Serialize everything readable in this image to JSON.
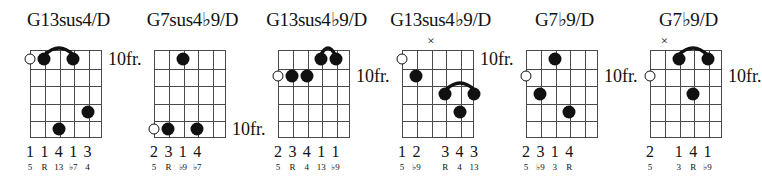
{
  "page": {
    "kind": "guitar-chord-chart",
    "fret_label": "10fr.",
    "x_mark": "×"
  },
  "chords": [
    {
      "id": "chord-1",
      "title": "G13sus4/D",
      "title_parts": {
        "text": "G13sus4/D"
      },
      "position_label": "10fr.",
      "position_label_fret_row": 1,
      "strings": 6,
      "frets": 5,
      "open_strings": [
        1
      ],
      "muted_strings": [],
      "dots": [
        {
          "string": 2,
          "fret": 1
        },
        {
          "string": 4,
          "fret": 1
        },
        {
          "string": 5,
          "fret": 4
        },
        {
          "string": 3,
          "fret": 5
        }
      ],
      "barres": [
        {
          "fret": 1,
          "from_string": 2,
          "to_string": 4
        }
      ],
      "fingers": [
        "1",
        "1",
        "4",
        "1",
        "3",
        ""
      ],
      "intervals": [
        "5",
        "R",
        "13",
        "♭7",
        "4",
        ""
      ]
    },
    {
      "id": "chord-2",
      "title": "G7sus4♭9/D",
      "title_parts": {
        "text": "G7sus4♭9/D"
      },
      "position_label": "10fr.",
      "position_label_fret_row": 5,
      "strings": 6,
      "frets": 5,
      "open_strings": [
        1
      ],
      "muted_strings": [],
      "dots": [
        {
          "string": 3,
          "fret": 1
        },
        {
          "string": 2,
          "fret": 5
        },
        {
          "string": 4,
          "fret": 5
        }
      ],
      "barres": [],
      "fingers": [
        "2",
        "3",
        "1",
        "4",
        "",
        ""
      ],
      "intervals": [
        "5",
        "R",
        "♭9",
        "♭7",
        "",
        ""
      ]
    },
    {
      "id": "chord-3",
      "title": "G13sus4♭9/D",
      "title_parts": {
        "text": "G13sus4♭9/D"
      },
      "position_label": "10fr.",
      "position_label_fret_row": 2,
      "strings": 6,
      "frets": 5,
      "open_strings": [
        1
      ],
      "muted_strings": [],
      "dots": [
        {
          "string": 4,
          "fret": 1
        },
        {
          "string": 5,
          "fret": 1
        },
        {
          "string": 2,
          "fret": 2
        },
        {
          "string": 3,
          "fret": 2
        }
      ],
      "barres": [
        {
          "fret": 1,
          "from_string": 4,
          "to_string": 5
        }
      ],
      "fingers": [
        "2",
        "3",
        "4",
        "1",
        "1",
        ""
      ],
      "intervals": [
        "5",
        "R",
        "4",
        "13",
        "♭9",
        ""
      ]
    },
    {
      "id": "chord-4",
      "title": "G13sus4♭9/D",
      "title_parts": {
        "text": "G13sus4♭9/D"
      },
      "position_label": "10fr.",
      "position_label_fret_row": 1,
      "strings": 6,
      "frets": 5,
      "open_strings": [
        1
      ],
      "muted_strings": [
        3
      ],
      "dots": [
        {
          "string": 2,
          "fret": 2
        },
        {
          "string": 4,
          "fret": 3
        },
        {
          "string": 6,
          "fret": 3
        },
        {
          "string": 5,
          "fret": 4
        }
      ],
      "barres": [
        {
          "fret": 3,
          "from_string": 4,
          "to_string": 6
        }
      ],
      "fingers": [
        "1",
        "2",
        "",
        "3",
        "4",
        "3"
      ],
      "intervals": [
        "5",
        "♭9",
        "",
        "R",
        "4",
        "13"
      ]
    },
    {
      "id": "chord-5",
      "title": "G7♭9/D",
      "title_parts": {
        "text": "G7♭9/D"
      },
      "position_label": "10fr.",
      "position_label_fret_row": 2,
      "strings": 6,
      "frets": 5,
      "open_strings": [
        1
      ],
      "muted_strings": [],
      "dots": [
        {
          "string": 3,
          "fret": 1
        },
        {
          "string": 2,
          "fret": 3
        },
        {
          "string": 4,
          "fret": 4
        }
      ],
      "barres": [],
      "fingers": [
        "2",
        "3",
        "1",
        "4",
        "",
        ""
      ],
      "intervals": [
        "5",
        "♭9",
        "3",
        "R",
        "",
        ""
      ]
    },
    {
      "id": "chord-6",
      "title": "G7♭9/D",
      "title_parts": {
        "text": "G7♭9/D"
      },
      "position_label": "10fr.",
      "position_label_fret_row": 2,
      "strings": 6,
      "frets": 5,
      "open_strings": [
        1
      ],
      "muted_strings": [
        2
      ],
      "dots": [
        {
          "string": 3,
          "fret": 1
        },
        {
          "string": 5,
          "fret": 1
        },
        {
          "string": 4,
          "fret": 3
        }
      ],
      "barres": [
        {
          "fret": 1,
          "from_string": 3,
          "to_string": 5
        }
      ],
      "fingers": [
        "2",
        "",
        "1",
        "4",
        "1",
        ""
      ],
      "intervals": [
        "5",
        "",
        "3",
        "R",
        "♭9",
        ""
      ]
    }
  ],
  "layout": {
    "chord_left_positions": [
      0,
      124,
      248,
      372,
      496,
      620
    ],
    "chord_width": 137,
    "board_left": 30,
    "board_top": 50,
    "board_width": 72,
    "board_height": 88,
    "title_top": 10
  }
}
